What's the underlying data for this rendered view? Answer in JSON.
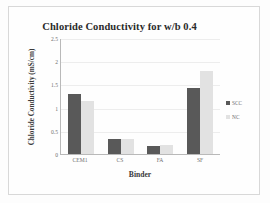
{
  "chart_data": {
    "type": "bar",
    "title": "Chloride Conductivity for w/b 0.4",
    "xlabel": "Binder",
    "ylabel": "Chloride Conductivity (mS/cm)",
    "categories": [
      "CEM1",
      "CS",
      "FA",
      "SF"
    ],
    "series": [
      {
        "name": "SCC",
        "color": "#595959",
        "values": [
          1.3,
          0.32,
          0.18,
          1.43
        ]
      },
      {
        "name": "NC",
        "color": "#e2e2e2",
        "values": [
          1.15,
          0.32,
          0.19,
          1.78
        ]
      }
    ],
    "ylim": [
      0,
      2.5
    ],
    "yticks": [
      "2.5",
      "2",
      "1.5",
      "1",
      "0.5",
      "0"
    ],
    "ytick_values": [
      2.5,
      2,
      1.5,
      1,
      0.5,
      0
    ],
    "grid": true,
    "legend_position": "right"
  }
}
